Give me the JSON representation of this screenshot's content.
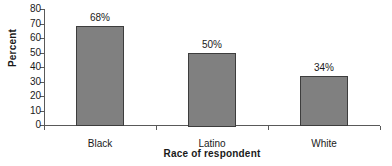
{
  "chart_data": {
    "type": "bar",
    "title": "",
    "categories": [
      "Black",
      "Latino",
      "White"
    ],
    "values": [
      68,
      50,
      34
    ],
    "value_labels": [
      "68%",
      "50%",
      "34%"
    ],
    "xlabel": "Race of respondent",
    "ylabel": "Percent",
    "ylim": [
      0,
      80
    ],
    "ytick_labels": [
      "0",
      "10",
      "20",
      "30",
      "40",
      "50",
      "60",
      "70",
      "80"
    ],
    "ytick_values": [
      0,
      10,
      20,
      30,
      40,
      50,
      60,
      70,
      80
    ],
    "grid": false,
    "legend": null,
    "series": [
      {
        "name": "Percent",
        "values": [
          68,
          50,
          34
        ]
      }
    ],
    "colors": {
      "bar_fill": "#808080",
      "bar_border": "#3d3d3d",
      "axis": "#595959",
      "text": "#1a1a1a",
      "background": "#ffffff"
    }
  }
}
